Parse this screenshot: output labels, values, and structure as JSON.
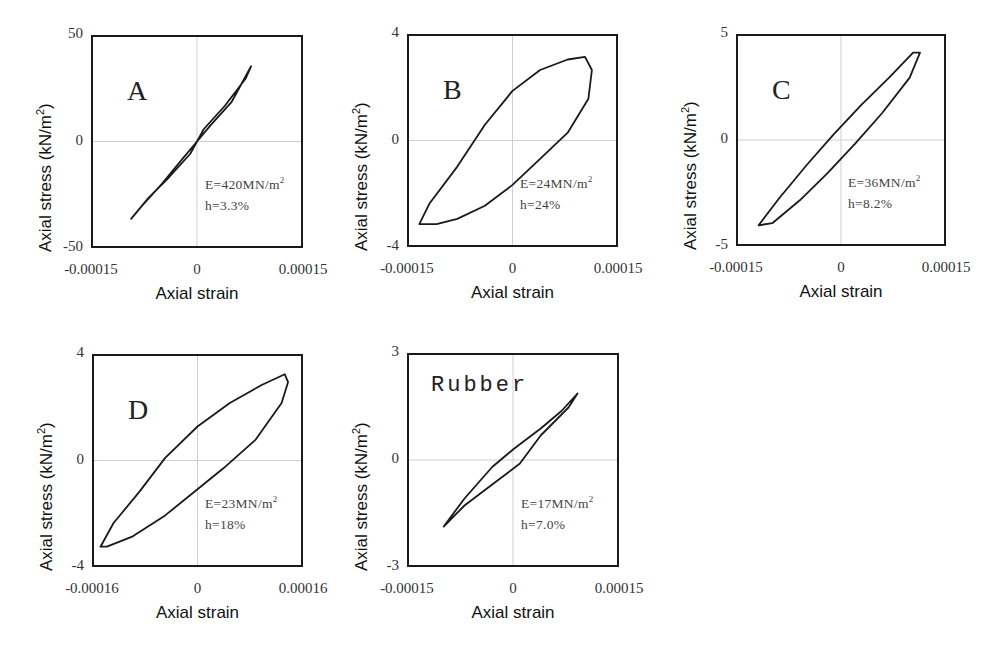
{
  "common": {
    "xlabel": "Axial strain",
    "ylabel_main": "Axial stress (kN/m",
    "ylabel_sup": "2",
    "ylabel_close": ")"
  },
  "panels": [
    {
      "id": "A",
      "label": "A",
      "frame": {
        "x": 91,
        "y": 35,
        "w": 212,
        "h": 213
      },
      "yticks": [
        "50",
        "0",
        "-50"
      ],
      "xticks": [
        "-0.00015",
        "0",
        "0.00015"
      ],
      "E_text": "E=420MN/m",
      "E_sup": "2",
      "h_text": "h=3.3%"
    },
    {
      "id": "B",
      "label": "B",
      "frame": {
        "x": 407,
        "y": 34,
        "w": 211,
        "h": 213
      },
      "yticks": [
        "4",
        "0",
        "-4"
      ],
      "xticks": [
        "-0.00015",
        "0",
        "0.00015"
      ],
      "E_text": "E=24MN/m",
      "E_sup": "2",
      "h_text": "h=24%"
    },
    {
      "id": "C",
      "label": "C",
      "frame": {
        "x": 736,
        "y": 34,
        "w": 210,
        "h": 212
      },
      "yticks": [
        "5",
        "0",
        "-5"
      ],
      "xticks": [
        "-0.00015",
        "0",
        "0.00015"
      ],
      "E_text": "E=36MN/m",
      "E_sup": "2",
      "h_text": "h=8.2%"
    },
    {
      "id": "D",
      "label": "D",
      "frame": {
        "x": 92,
        "y": 354,
        "w": 211,
        "h": 213
      },
      "yticks": [
        "4",
        "0",
        "-4"
      ],
      "xticks": [
        "-0.00016",
        "0",
        "0.00016"
      ],
      "E_text": "E=23MN/m",
      "E_sup": "2",
      "h_text": "h=18%"
    },
    {
      "id": "Rubber",
      "label": "Rubber",
      "frame": {
        "x": 407,
        "y": 353,
        "w": 212,
        "h": 214
      },
      "yticks": [
        "3",
        "0",
        "-3"
      ],
      "xticks": [
        "-0.00015",
        "0",
        "0.00015"
      ],
      "E_text": "E=17MN/m",
      "E_sup": "2",
      "h_text": "h=7.0%"
    }
  ],
  "chart_data": [
    {
      "type": "line",
      "title": "A",
      "xlabel": "Axial strain",
      "ylabel": "Axial stress (kN/m2)",
      "xlim": [
        -0.00015,
        0.00015
      ],
      "ylim": [
        -50,
        50
      ],
      "xticks": [
        -0.00015,
        0,
        0.00015
      ],
      "yticks": [
        -50,
        0,
        50
      ],
      "grid": "zero lines only",
      "annotations": [
        "E=420MN/m2",
        "h=3.3%"
      ],
      "series": [
        {
          "name": "hysteresis loop",
          "closed": true,
          "x": [
            -9.5e-05,
            -7e-05,
            -4e-05,
            -1e-05,
            0.0,
            2e-05,
            5e-05,
            7.8e-05,
            7e-05,
            4e-05,
            1e-05,
            0.0,
            -2e-05,
            -5e-05,
            -8e-05,
            -9.5e-05
          ],
          "y": [
            -37,
            -27,
            -17,
            -6,
            0,
            8,
            19,
            36,
            30,
            17,
            6,
            0,
            -8,
            -20,
            -31,
            -37
          ]
        }
      ]
    },
    {
      "type": "line",
      "title": "B",
      "xlabel": "Axial strain",
      "ylabel": "Axial stress (kN/m2)",
      "xlim": [
        -0.00015,
        0.00015
      ],
      "ylim": [
        -4,
        4
      ],
      "xticks": [
        -0.00015,
        0,
        0.00015
      ],
      "yticks": [
        -4,
        0,
        4
      ],
      "grid": "zero lines only",
      "annotations": [
        "E=24MN/m2",
        "h=24%"
      ],
      "series": [
        {
          "name": "hysteresis loop",
          "closed": true,
          "x": [
            -0.000135,
            -0.00012,
            -8e-05,
            -4e-05,
            0.0,
            4e-05,
            8e-05,
            0.000105,
            0.000115,
            0.00011,
            8e-05,
            4e-05,
            0.0,
            -4e-05,
            -8e-05,
            -0.00011,
            -0.00013,
            -0.000135
          ],
          "y": [
            -3.2,
            -2.4,
            -1.0,
            0.6,
            1.9,
            2.7,
            3.1,
            3.2,
            2.7,
            1.6,
            0.3,
            -0.7,
            -1.7,
            -2.5,
            -3.0,
            -3.2,
            -3.2,
            -3.2
          ]
        }
      ]
    },
    {
      "type": "line",
      "title": "C",
      "xlabel": "Axial strain",
      "ylabel": "Axial stress (kN/m2)",
      "xlim": [
        -0.00015,
        0.00015
      ],
      "ylim": [
        -5,
        5
      ],
      "xticks": [
        -0.00015,
        0,
        0.00015
      ],
      "yticks": [
        -5,
        0,
        5
      ],
      "grid": "zero lines only",
      "annotations": [
        "E=36MN/m2",
        "h=8.2%"
      ],
      "series": [
        {
          "name": "hysteresis loop",
          "closed": true,
          "x": [
            -0.00012,
            -9e-05,
            -5e-05,
            -1e-05,
            3e-05,
            7e-05,
            0.000105,
            0.000115,
            0.0001,
            6e-05,
            2e-05,
            -2e-05,
            -6e-05,
            -0.0001,
            -0.00012
          ],
          "y": [
            -4.1,
            -2.8,
            -1.2,
            0.3,
            1.7,
            3.0,
            4.2,
            4.2,
            3.0,
            1.3,
            -0.2,
            -1.6,
            -2.9,
            -4.0,
            -4.1
          ]
        }
      ]
    },
    {
      "type": "line",
      "title": "D",
      "xlabel": "Axial strain",
      "ylabel": "Axial stress (kN/m2)",
      "xlim": [
        -0.00016,
        0.00016
      ],
      "ylim": [
        -4,
        4
      ],
      "xticks": [
        -0.00016,
        0,
        0.00016
      ],
      "yticks": [
        -4,
        0,
        4
      ],
      "grid": "zero lines only",
      "annotations": [
        "E=23MN/m2",
        "h=18%"
      ],
      "series": [
        {
          "name": "hysteresis loop",
          "closed": true,
          "x": [
            -0.00015,
            -0.00013,
            -9e-05,
            -5e-05,
            0.0,
            5e-05,
            0.0001,
            0.000135,
            0.00014,
            0.00013,
            9e-05,
            4e-05,
            0.0,
            -5e-05,
            -0.0001,
            -0.00014,
            -0.00015
          ],
          "y": [
            -3.3,
            -2.4,
            -1.2,
            0.1,
            1.3,
            2.2,
            2.9,
            3.3,
            3.0,
            2.2,
            0.8,
            -0.3,
            -1.1,
            -2.1,
            -2.9,
            -3.3,
            -3.3
          ]
        }
      ]
    },
    {
      "type": "line",
      "title": "Rubber",
      "xlabel": "Axial strain",
      "ylabel": "Axial stress (kN/m2)",
      "xlim": [
        -0.00015,
        0.00015
      ],
      "ylim": [
        -3,
        3
      ],
      "xticks": [
        -0.00015,
        0,
        0.00015
      ],
      "yticks": [
        -3,
        0,
        3
      ],
      "grid": "zero lines only",
      "annotations": [
        "E=17MN/m2",
        "h=7.0%"
      ],
      "series": [
        {
          "name": "hysteresis loop",
          "closed": true,
          "x": [
            -0.0001,
            -7e-05,
            -3e-05,
            0.0,
            4e-05,
            7e-05,
            9.3e-05,
            8e-05,
            4e-05,
            1e-05,
            -3e-05,
            -7e-05,
            -0.0001
          ],
          "y": [
            -1.9,
            -1.1,
            -0.2,
            0.3,
            0.9,
            1.4,
            1.9,
            1.5,
            0.7,
            -0.1,
            -0.7,
            -1.3,
            -1.9
          ]
        }
      ]
    }
  ]
}
